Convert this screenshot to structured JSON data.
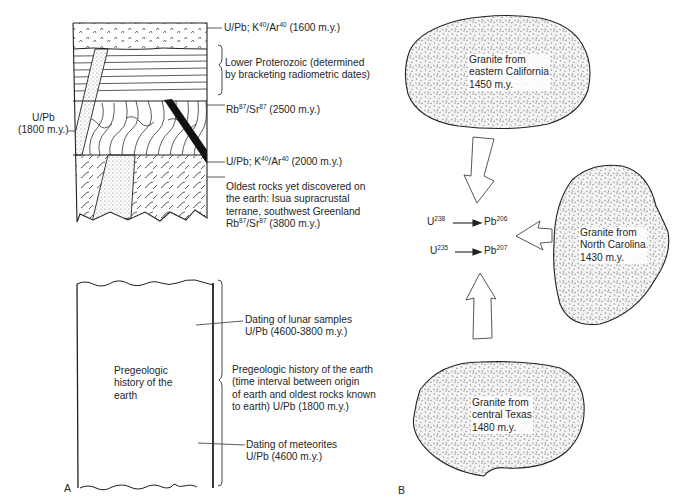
{
  "panel_a": {
    "letter": "A",
    "column_labels": {
      "top_volcanics": {
        "pre": "U/Pb; K",
        "sup1": "40",
        "mid": "/Ar",
        "sup2": "40",
        "post": " (1600 m.y.)"
      },
      "lower_proterozoic": [
        "Lower Proterozoic (determined",
        "by bracketing radiometric dates)"
      ],
      "folded_rocks": {
        "pre": "Rb",
        "sup1": "87",
        "mid": "/Sr",
        "sup2": "87",
        "post": " (2500 m.y.)"
      },
      "dike": {
        "pre": "U/Pb; K",
        "sup1": "40",
        "mid": "/Ar",
        "sup2": "40",
        "post": " (2000 m.y.)"
      },
      "oldest_rocks": [
        "Oldest rocks yet discovered on",
        "the earth: Isua supracrustal",
        "terrane, southwest Greenland"
      ],
      "oldest_rocks_date": {
        "pre": "Rb",
        "sup1": "87",
        "mid": "/Sr",
        "sup2": "87",
        "post": " (3800 m.y.)"
      },
      "intrusion": [
        "U/Pb",
        "(1800 m.y.)"
      ]
    },
    "pregeologic": {
      "inner_label": [
        "Pregeologic",
        "history of the",
        "earth"
      ],
      "lunar": [
        "Dating of lunar samples",
        "U/Pb (4600-3800 m.y.)"
      ],
      "brace_label": [
        "Pregeologic history of the earth",
        "(time interval between origin",
        "of earth and oldest rocks known",
        "to earth) U/Pb (1800 m.y.)"
      ],
      "meteorites": [
        "Dating of meteorites",
        "U/Pb (4600 m.y.)"
      ]
    }
  },
  "panel_b": {
    "letter": "B",
    "granites": [
      {
        "id": "california",
        "lines": [
          "Granite from",
          "eastern California",
          "1450 m.y."
        ]
      },
      {
        "id": "north-carolina",
        "lines": [
          "Granite from",
          "North Carolina",
          "1430 m.y."
        ]
      },
      {
        "id": "texas",
        "lines": [
          "Granite from",
          "central Texas",
          "1480 m.y."
        ]
      }
    ],
    "decay": [
      {
        "parent": "U",
        "parent_mass": "238",
        "daughter": "Pb",
        "daughter_mass": "206"
      },
      {
        "parent": "U",
        "parent_mass": "235",
        "daughter": "Pb",
        "daughter_mass": "207"
      }
    ]
  }
}
